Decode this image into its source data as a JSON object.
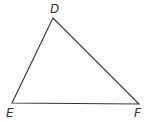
{
  "diagram": {
    "type": "triangle",
    "stroke_color": "#333333",
    "vertices": [
      {
        "label": "D",
        "x": 53,
        "y": 18,
        "lx": 50,
        "ly": 13
      },
      {
        "label": "E",
        "x": 12,
        "y": 103,
        "lx": 6,
        "ly": 117
      },
      {
        "label": "F",
        "x": 139,
        "y": 104,
        "lx": 134,
        "ly": 117
      }
    ]
  }
}
